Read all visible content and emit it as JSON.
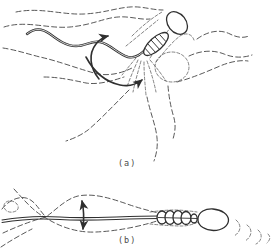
{
  "figure": {
    "colors": {
      "background": "#ffffff",
      "ink": "#2f2f2f",
      "streamline": "#4f4f4f",
      "label": "#4a4a4a"
    },
    "panels": {
      "a": {
        "label": "(a)"
      },
      "b": {
        "label": "(b)"
      }
    }
  }
}
